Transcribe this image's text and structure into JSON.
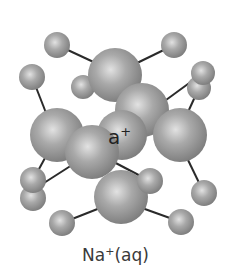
{
  "diagram": {
    "caption": {
      "base": "Na",
      "charge": "+",
      "state": "(aq)"
    },
    "center_label": {
      "visible_text": "a",
      "charge": "+"
    },
    "colors": {
      "atom": "#8f8f8f",
      "atom_highlight": "#d8d8d8",
      "bond": "#2a2a2a",
      "background": "#ffffff"
    }
  }
}
